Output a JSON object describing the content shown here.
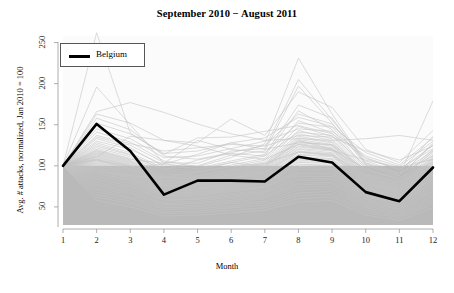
{
  "chart_data": {
    "type": "line",
    "title": "September 2010 − August 2011",
    "xlabel": "Month",
    "ylabel": "Avg. # attacks, normalized, Jan 2010 = 100",
    "xlim": [
      1,
      12
    ],
    "ylim": [
      28,
      258
    ],
    "grid": false,
    "x": [
      1,
      2,
      3,
      4,
      5,
      6,
      7,
      8,
      9,
      10,
      11,
      12
    ],
    "xticklabels": [
      "1",
      "2",
      "3",
      "4",
      "5",
      "6",
      "7",
      "8",
      "9",
      "10",
      "11",
      "12"
    ],
    "yticks": [
      50,
      100,
      150,
      200,
      250
    ],
    "yticklabels": [
      "50",
      "100",
      "150",
      "200",
      "250"
    ],
    "legend": {
      "position": "top-left",
      "entries": [
        {
          "name": "Belgium",
          "color": "#000000",
          "linewidth": 2.6
        }
      ]
    },
    "shaded_band": {
      "description": "gray band spanning plot width from y=28 to y=100",
      "y_from": 28,
      "y_to": 100,
      "color": "#b9b9b9"
    },
    "highlight_color": "#000000",
    "background_series_color": "#c4c4c4",
    "panel_background": "#fbfbfb",
    "series": [
      {
        "name": "Belgium",
        "highlight": true,
        "values": [
          100,
          151,
          118,
          65,
          82,
          82,
          81,
          111,
          104,
          68,
          57,
          98
        ]
      },
      {
        "name": "bg01",
        "highlight": false,
        "values": [
          100,
          196,
          150,
          103,
          96,
          104,
          99,
          131,
          120,
          96,
          83,
          117
        ]
      },
      {
        "name": "bg02",
        "highlight": false,
        "values": [
          100,
          166,
          177,
          165,
          151,
          139,
          131,
          133,
          131,
          133,
          137,
          131
        ]
      },
      {
        "name": "bg03",
        "highlight": false,
        "values": [
          100,
          262,
          140,
          114,
          134,
          135,
          142,
          149,
          139,
          110,
          96,
          121
        ]
      },
      {
        "name": "bg04",
        "highlight": false,
        "values": [
          100,
          163,
          152,
          131,
          128,
          157,
          137,
          190,
          171,
          120,
          104,
          143
        ]
      },
      {
        "name": "bg05",
        "highlight": false,
        "values": [
          100,
          141,
          129,
          106,
          99,
          110,
          127,
          231,
          163,
          103,
          88,
          179
        ]
      },
      {
        "name": "bg06",
        "highlight": false,
        "values": [
          100,
          135,
          125,
          104,
          103,
          118,
          121,
          205,
          156,
          106,
          92,
          136
        ]
      },
      {
        "name": "bg07",
        "highlight": false,
        "values": [
          100,
          130,
          120,
          101,
          100,
          113,
          118,
          197,
          152,
          101,
          86,
          128
        ]
      },
      {
        "name": "bg08",
        "highlight": false,
        "values": [
          100,
          128,
          116,
          97,
          94,
          104,
          112,
          167,
          144,
          98,
          84,
          120
        ]
      },
      {
        "name": "bg09",
        "highlight": false,
        "values": [
          100,
          124,
          113,
          95,
          92,
          101,
          109,
          155,
          140,
          96,
          82,
          118
        ]
      },
      {
        "name": "bg10",
        "highlight": false,
        "values": [
          100,
          122,
          111,
          93,
          91,
          99,
          107,
          148,
          136,
          94,
          80,
          115
        ]
      },
      {
        "name": "bg11",
        "highlight": false,
        "values": [
          100,
          120,
          109,
          91,
          89,
          97,
          105,
          143,
          133,
          92,
          79,
          113
        ]
      },
      {
        "name": "bg12",
        "highlight": false,
        "values": [
          100,
          118,
          107,
          90,
          88,
          96,
          103,
          139,
          131,
          91,
          78,
          111
        ]
      },
      {
        "name": "bg13",
        "highlight": false,
        "values": [
          100,
          117,
          106,
          88,
          87,
          95,
          102,
          136,
          129,
          90,
          77,
          110
        ]
      },
      {
        "name": "bg14",
        "highlight": false,
        "values": [
          100,
          116,
          105,
          87,
          86,
          94,
          101,
          134,
          128,
          89,
          76,
          109
        ]
      },
      {
        "name": "bg15",
        "highlight": false,
        "values": [
          100,
          115,
          104,
          86,
          85,
          93,
          100,
          132,
          126,
          88,
          75,
          108
        ]
      },
      {
        "name": "bg16",
        "highlight": false,
        "values": [
          100,
          114,
          103,
          85,
          84,
          92,
          99,
          130,
          125,
          87,
          74,
          107
        ]
      },
      {
        "name": "bg17",
        "highlight": false,
        "values": [
          100,
          113,
          102,
          84,
          84,
          91,
          98,
          129,
          124,
          86,
          74,
          106
        ]
      },
      {
        "name": "bg18",
        "highlight": false,
        "values": [
          100,
          112,
          101,
          83,
          83,
          90,
          97,
          127,
          122,
          86,
          73,
          105
        ]
      },
      {
        "name": "bg19",
        "highlight": false,
        "values": [
          100,
          111,
          100,
          82,
          82,
          89,
          96,
          126,
          121,
          85,
          72,
          104
        ]
      },
      {
        "name": "bg20",
        "highlight": false,
        "values": [
          100,
          110,
          100,
          81,
          81,
          89,
          95,
          124,
          120,
          84,
          72,
          103
        ]
      },
      {
        "name": "bg21",
        "highlight": false,
        "values": [
          100,
          109,
          99,
          81,
          81,
          88,
          94,
          123,
          119,
          83,
          71,
          102
        ]
      },
      {
        "name": "bg22",
        "highlight": false,
        "values": [
          100,
          108,
          98,
          80,
          80,
          87,
          93,
          121,
          118,
          82,
          70,
          101
        ]
      },
      {
        "name": "bg23",
        "highlight": false,
        "values": [
          100,
          108,
          97,
          79,
          79,
          86,
          92,
          120,
          116,
          82,
          70,
          100
        ]
      },
      {
        "name": "bg24",
        "highlight": false,
        "values": [
          100,
          107,
          96,
          78,
          79,
          85,
          92,
          118,
          115,
          81,
          69,
          99
        ]
      },
      {
        "name": "bg25",
        "highlight": false,
        "values": [
          100,
          106,
          96,
          78,
          78,
          85,
          91,
          117,
          114,
          80,
          69,
          98
        ]
      },
      {
        "name": "bg26",
        "highlight": false,
        "values": [
          100,
          105,
          95,
          77,
          77,
          84,
          90,
          116,
          113,
          79,
          68,
          97
        ]
      },
      {
        "name": "bg27",
        "highlight": false,
        "values": [
          100,
          104,
          94,
          76,
          77,
          83,
          89,
          114,
          112,
          79,
          67,
          96
        ]
      },
      {
        "name": "bg28",
        "highlight": false,
        "values": [
          100,
          103,
          93,
          76,
          76,
          82,
          88,
          113,
          111,
          78,
          67,
          95
        ]
      },
      {
        "name": "bg29",
        "highlight": false,
        "values": [
          100,
          102,
          92,
          75,
          75,
          81,
          87,
          111,
          109,
          77,
          66,
          94
        ]
      },
      {
        "name": "bg30",
        "highlight": false,
        "values": [
          100,
          101,
          91,
          74,
          74,
          80,
          86,
          110,
          108,
          76,
          65,
          93
        ]
      },
      {
        "name": "bg31",
        "highlight": false,
        "values": [
          100,
          100,
          90,
          73,
          73,
          79,
          85,
          108,
          107,
          75,
          64,
          92
        ]
      },
      {
        "name": "bg32",
        "highlight": false,
        "values": [
          100,
          99,
          89,
          72,
          72,
          78,
          84,
          107,
          105,
          74,
          64,
          91
        ]
      },
      {
        "name": "bg33",
        "highlight": false,
        "values": [
          100,
          98,
          88,
          71,
          72,
          77,
          83,
          105,
          104,
          73,
          63,
          90
        ]
      },
      {
        "name": "bg34",
        "highlight": false,
        "values": [
          100,
          97,
          87,
          70,
          71,
          76,
          82,
          104,
          103,
          73,
          62,
          89
        ]
      },
      {
        "name": "bg35",
        "highlight": false,
        "values": [
          100,
          96,
          86,
          69,
          70,
          75,
          81,
          102,
          101,
          72,
          61,
          88
        ]
      },
      {
        "name": "bg36",
        "highlight": false,
        "values": [
          100,
          95,
          85,
          68,
          69,
          74,
          80,
          101,
          100,
          71,
          61,
          86
        ]
      },
      {
        "name": "bg37",
        "highlight": false,
        "values": [
          100,
          94,
          84,
          67,
          68,
          73,
          79,
          99,
          99,
          70,
          60,
          85
        ]
      },
      {
        "name": "bg38",
        "highlight": false,
        "values": [
          100,
          92,
          83,
          66,
          67,
          72,
          78,
          98,
          97,
          69,
          59,
          84
        ]
      },
      {
        "name": "bg39",
        "highlight": false,
        "values": [
          100,
          91,
          82,
          65,
          66,
          71,
          76,
          96,
          96,
          68,
          58,
          83
        ]
      },
      {
        "name": "bg40",
        "highlight": false,
        "values": [
          100,
          90,
          81,
          64,
          65,
          70,
          75,
          94,
          94,
          67,
          57,
          81
        ]
      },
      {
        "name": "bg41",
        "highlight": false,
        "values": [
          100,
          88,
          79,
          63,
          64,
          69,
          74,
          92,
          92,
          66,
          56,
          80
        ]
      },
      {
        "name": "bg42",
        "highlight": false,
        "values": [
          100,
          87,
          78,
          62,
          63,
          68,
          73,
          91,
          91,
          64,
          55,
          78
        ]
      },
      {
        "name": "bg43",
        "highlight": false,
        "values": [
          100,
          85,
          76,
          60,
          61,
          66,
          71,
          89,
          89,
          63,
          54,
          77
        ]
      },
      {
        "name": "bg44",
        "highlight": false,
        "values": [
          100,
          84,
          75,
          59,
          60,
          65,
          69,
          87,
          87,
          62,
          53,
          75
        ]
      },
      {
        "name": "bg45",
        "highlight": false,
        "values": [
          100,
          82,
          73,
          58,
          59,
          63,
          68,
          84,
          85,
          60,
          51,
          73
        ]
      },
      {
        "name": "bg46",
        "highlight": false,
        "values": [
          100,
          80,
          71,
          56,
          57,
          62,
          66,
          82,
          83,
          59,
          50,
          71
        ]
      },
      {
        "name": "bg47",
        "highlight": false,
        "values": [
          100,
          78,
          69,
          54,
          55,
          60,
          64,
          79,
          80,
          57,
          48,
          69
        ]
      },
      {
        "name": "bg48",
        "highlight": false,
        "values": [
          100,
          76,
          67,
          53,
          54,
          58,
          62,
          77,
          78,
          55,
          47,
          67
        ]
      },
      {
        "name": "bg49",
        "highlight": false,
        "values": [
          100,
          73,
          65,
          51,
          52,
          56,
          60,
          74,
          75,
          53,
          45,
          64
        ]
      },
      {
        "name": "bg50",
        "highlight": false,
        "values": [
          100,
          71,
          62,
          49,
          50,
          54,
          57,
          71,
          72,
          51,
          43,
          62
        ]
      },
      {
        "name": "bg51",
        "highlight": false,
        "values": [
          100,
          68,
          60,
          47,
          48,
          51,
          55,
          67,
          69,
          49,
          41,
          59
        ]
      },
      {
        "name": "bg52",
        "highlight": false,
        "values": [
          100,
          65,
          57,
          44,
          45,
          49,
          52,
          64,
          65,
          46,
          39,
          56
        ]
      },
      {
        "name": "bg53",
        "highlight": false,
        "values": [
          100,
          62,
          54,
          42,
          43,
          46,
          49,
          60,
          62,
          43,
          37,
          53
        ]
      },
      {
        "name": "bg54",
        "highlight": false,
        "values": [
          100,
          58,
          50,
          39,
          40,
          43,
          46,
          56,
          58,
          40,
          34,
          49
        ]
      },
      {
        "name": "bg55",
        "highlight": false,
        "values": [
          100,
          137,
          127,
          118,
          122,
          126,
          124,
          137,
          135,
          118,
          107,
          124
        ]
      },
      {
        "name": "bg56",
        "highlight": false,
        "values": [
          100,
          145,
          133,
          110,
          112,
          121,
          130,
          145,
          142,
          112,
          99,
          130
        ]
      },
      {
        "name": "bg57",
        "highlight": false,
        "values": [
          100,
          152,
          139,
          115,
          118,
          128,
          134,
          159,
          148,
          116,
          101,
          134
        ]
      },
      {
        "name": "bg58",
        "highlight": false,
        "values": [
          100,
          126,
          114,
          95,
          107,
          115,
          112,
          141,
          137,
          100,
          88,
          126
        ]
      },
      {
        "name": "bg59",
        "highlight": false,
        "values": [
          100,
          119,
          108,
          103,
          131,
          120,
          116,
          152,
          147,
          104,
          91,
          112
        ]
      },
      {
        "name": "bg60",
        "highlight": false,
        "values": [
          100,
          133,
          122,
          99,
          97,
          106,
          114,
          174,
          158,
          102,
          90,
          119
        ]
      },
      {
        "name": "bg61",
        "highlight": false,
        "values": [
          100,
          158,
          144,
          112,
          108,
          116,
          125,
          163,
          151,
          109,
          95,
          125
        ]
      },
      {
        "name": "bg62",
        "highlight": false,
        "values": [
          100,
          107,
          99,
          102,
          114,
          128,
          120,
          128,
          126,
          95,
          85,
          104
        ]
      },
      {
        "name": "bg63",
        "highlight": false,
        "values": [
          100,
          93,
          88,
          86,
          93,
          99,
          103,
          117,
          113,
          88,
          81,
          100
        ]
      },
      {
        "name": "bg64",
        "highlight": false,
        "values": [
          100,
          111,
          136,
          131,
          124,
          113,
          108,
          126,
          119,
          107,
          98,
          108
        ]
      }
    ]
  }
}
